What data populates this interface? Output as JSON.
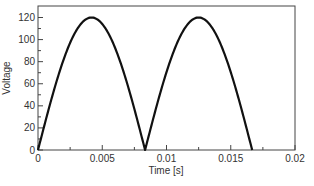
{
  "chart_data": {
    "type": "line",
    "title": "",
    "xlabel": "Time [s]",
    "ylabel": "Voltage",
    "xlim": [
      0,
      0.02
    ],
    "ylim": [
      0,
      130
    ],
    "xticks": [
      0,
      0.005,
      0.01,
      0.015,
      0.02
    ],
    "xtick_labels": [
      "0",
      "0.005",
      "0.01",
      "0.015",
      "0.02"
    ],
    "yticks": [
      0,
      20,
      40,
      60,
      80,
      100,
      120
    ],
    "ytick_labels": [
      "0",
      "20",
      "40",
      "60",
      "80",
      "100",
      "120"
    ],
    "grid": false,
    "legend": null,
    "series": [
      {
        "name": "Full-wave rectified voltage",
        "color": "#111111",
        "description": "|120 sin(2*pi*60*t)| for t in [0, 1/60]",
        "x": [
          0,
          0.001,
          0.002,
          0.003,
          0.004,
          0.004167,
          0.005,
          0.006,
          0.007,
          0.008,
          0.008333,
          0.009,
          0.01,
          0.011,
          0.012,
          0.0125,
          0.013,
          0.014,
          0.015,
          0.016,
          0.016667
        ],
        "y": [
          0,
          44.6,
          83.3,
          109.6,
          119.8,
          120,
          114.1,
          97.1,
          70.5,
          37.1,
          0,
          29.8,
          70.5,
          101.9,
          119.0,
          120,
          117.9,
          97.1,
          60.0,
          29.8,
          0
        ]
      }
    ]
  }
}
